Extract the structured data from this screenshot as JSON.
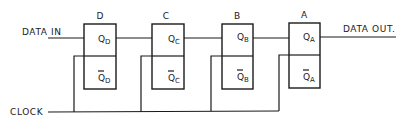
{
  "diagram": {
    "type": "shift-register",
    "inputs": {
      "data_in": "DATA IN",
      "clock": "CLOCK"
    },
    "output": {
      "data_out": "DATA OUT."
    },
    "flip_flops": [
      {
        "name": "D",
        "q": "Q",
        "q_sub": "D",
        "qbar": "Q",
        "qbar_sub": "D"
      },
      {
        "name": "C",
        "q": "Q",
        "q_sub": "C",
        "qbar": "Q",
        "qbar_sub": "C"
      },
      {
        "name": "B",
        "q": "Q",
        "q_sub": "B",
        "qbar": "Q",
        "qbar_sub": "B"
      },
      {
        "name": "A",
        "q": "Q",
        "q_sub": "A",
        "qbar": "Q",
        "qbar_sub": "A"
      }
    ]
  }
}
